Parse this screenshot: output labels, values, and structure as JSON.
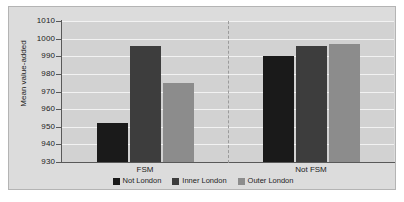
{
  "chart_data": {
    "type": "bar",
    "title": "",
    "xlabel": "",
    "ylabel": "Mean value-added",
    "categories": [
      "FSM",
      "Not FSM"
    ],
    "series": [
      {
        "name": "Not London",
        "color": "#1a1a1a",
        "values": [
          952,
          990
        ]
      },
      {
        "name": "Inner London",
        "color": "#3d3d3d",
        "values": [
          996,
          996
        ]
      },
      {
        "name": "Outer London",
        "color": "#8c8c8c",
        "values": [
          975,
          997
        ]
      }
    ],
    "ylim": [
      930,
      1010
    ],
    "yticks": [
      1010,
      1000,
      990,
      980,
      970,
      960,
      950,
      940,
      930
    ],
    "ytick_labels": [
      "1010",
      "1000",
      "990",
      "980",
      "970",
      "960",
      "950",
      "940",
      "930"
    ],
    "grid": true,
    "legend_position": "bottom",
    "group_divider": true,
    "plot_background": "#d2d2d2",
    "panel_background": "#dcdcdc",
    "gridline_color": "#f2f2f2",
    "axis_color": "#595959"
  }
}
